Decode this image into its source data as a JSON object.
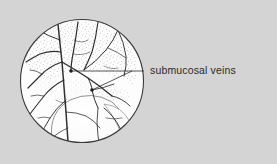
{
  "figure": {
    "kind": "endoscopic-line-drawing",
    "title": "submucosal veins",
    "background_color": "#d4d4d4",
    "ink_color": "#2b2b2b",
    "field_fill": "#fdfdfd",
    "circle": {
      "center_x": 82,
      "center_y": 81,
      "radius": 62,
      "stroke_color": "#3a3a3a",
      "stroke_width": 1.1
    },
    "label": {
      "text": "submucosal veins",
      "x": 150,
      "y": 64,
      "font_size_px": 10.5,
      "color": "#2b2b2b"
    },
    "leader": {
      "stroke_color": "#2b2b2b",
      "stroke_width": 0.8,
      "horizontal_y": 71,
      "start_x": 144,
      "end_x": 71
    },
    "markers": [
      {
        "name": "upper-vein-marker",
        "x": 71,
        "y": 71,
        "r": 1.8
      },
      {
        "name": "lower-vein-marker",
        "x": 92,
        "y": 90,
        "r": 1.8
      }
    ],
    "anatomy": {
      "varix_label": "dilated submucosal varix",
      "stipple_label": "mucosal stippling",
      "vein_count": 14
    }
  }
}
